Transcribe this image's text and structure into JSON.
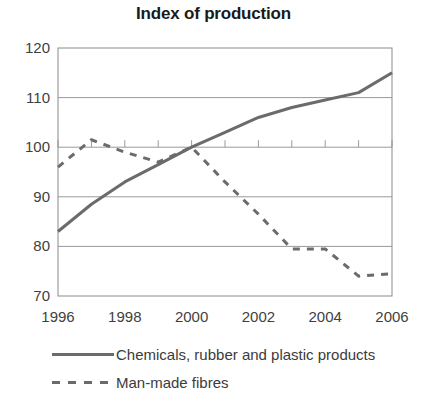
{
  "chart_data": {
    "type": "line",
    "title": "Index of production",
    "xlabel": "",
    "ylabel": "",
    "x": [
      1996,
      1997,
      1998,
      1999,
      2000,
      2001,
      2002,
      2003,
      2004,
      2005,
      2006
    ],
    "xlim": [
      1996,
      2006
    ],
    "ylim": [
      70,
      120
    ],
    "xticks": [
      1996,
      1998,
      2000,
      2002,
      2004,
      2006
    ],
    "xtick_labels": [
      "1996",
      "1998",
      "2000",
      "2002",
      "2004",
      "2006"
    ],
    "yticks": [
      70,
      80,
      90,
      100,
      110,
      120
    ],
    "ytick_labels": [
      "70",
      "80",
      "90",
      "100",
      "110",
      "120"
    ],
    "grid": "horizontal",
    "legend_position": "bottom-left",
    "series": [
      {
        "name": "Chemicals, rubber and plastic products",
        "style": "solid",
        "color": "#6b6b6b",
        "values": [
          83,
          88.5,
          93,
          96.5,
          100,
          103,
          106,
          108,
          109.5,
          111,
          115
        ]
      },
      {
        "name": "Man-made fibres",
        "style": "dashed",
        "color": "#6b6b6b",
        "values": [
          96,
          101.5,
          99,
          97,
          100,
          93,
          86.5,
          79.5,
          79.5,
          74,
          74.5
        ]
      }
    ]
  },
  "legend": {
    "items": [
      {
        "label": "Chemicals, rubber and plastic products",
        "style": "solid"
      },
      {
        "label": "Man-made fibres",
        "style": "dashed"
      }
    ]
  }
}
